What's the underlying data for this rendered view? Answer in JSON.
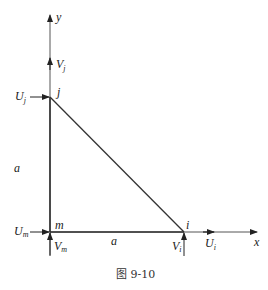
{
  "diagram": {
    "caption": "图 9-10",
    "axes": {
      "x_label": "x",
      "y_label": "y"
    },
    "nodes": [
      {
        "id": "m",
        "label": "m",
        "x": 50,
        "y": 232
      },
      {
        "id": "i",
        "label": "i",
        "x": 184,
        "y": 232
      },
      {
        "id": "j",
        "label": "j",
        "x": 50,
        "y": 97
      }
    ],
    "edges": [
      {
        "from": "m",
        "to": "i",
        "label": "a"
      },
      {
        "from": "m",
        "to": "j",
        "label": "a"
      },
      {
        "from": "i",
        "to": "j",
        "label": ""
      }
    ],
    "forces": [
      {
        "label": "U",
        "subscript": "j",
        "node": "j",
        "direction": "+x"
      },
      {
        "label": "V",
        "subscript": "j",
        "node": "j",
        "direction": "+y"
      },
      {
        "label": "U",
        "subscript": "m",
        "node": "m",
        "direction": "+x"
      },
      {
        "label": "V",
        "subscript": "m",
        "node": "m",
        "direction": "+y"
      },
      {
        "label": "U",
        "subscript": "i",
        "node": "i",
        "direction": "+x"
      },
      {
        "label": "V",
        "subscript": "i",
        "node": "i",
        "direction": "+y"
      }
    ],
    "colors": {
      "line": "#333333",
      "axis": "#555555",
      "background": "#ffffff"
    }
  }
}
